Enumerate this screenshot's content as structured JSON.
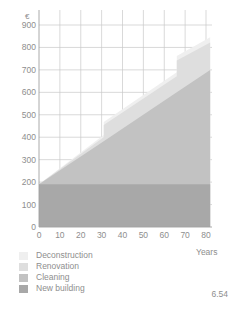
{
  "figure": {
    "number": "6.54"
  },
  "chart_data": {
    "type": "area",
    "title": "",
    "subtitle": "",
    "xlabel": "Years",
    "ylabel": "€",
    "xlim": [
      0,
      82
    ],
    "ylim": [
      0,
      950
    ],
    "grid": true,
    "stacked": true,
    "legend_position": "below",
    "xticks": [
      0,
      10,
      20,
      30,
      40,
      50,
      60,
      70,
      80
    ],
    "xtick_labels": [
      "0",
      "10",
      "20",
      "30",
      "40",
      "50",
      "60",
      "70",
      "80"
    ],
    "yticks": [
      0,
      100,
      200,
      300,
      400,
      500,
      600,
      700,
      800,
      900
    ],
    "ytick_labels": [
      "0",
      "100",
      "200",
      "300",
      "400",
      "500",
      "600",
      "700",
      "800",
      "900"
    ],
    "x": [
      0,
      31,
      31,
      66,
      66,
      82
    ],
    "series": [
      {
        "name": "New building",
        "color": "#a8a8a8",
        "cumulative_top": [
          190,
          190,
          190,
          190,
          190,
          190
        ]
      },
      {
        "name": "Cleaning",
        "color": "#c2c2c2",
        "cumulative_top": [
          190,
          382,
          382,
          600,
          600,
          700
        ]
      },
      {
        "name": "Renovation",
        "color": "#dedede",
        "cumulative_top": [
          190,
          400,
          455,
          672,
          742,
          822
        ]
      },
      {
        "name": "Deconstruction",
        "color": "#efefef",
        "cumulative_top": [
          190,
          410,
          468,
          690,
          762,
          845
        ]
      }
    ]
  },
  "legend": {
    "items": [
      {
        "label": "Deconstruction",
        "color": "#efefef"
      },
      {
        "label": "Renovation",
        "color": "#dedede"
      },
      {
        "label": "Cleaning",
        "color": "#c2c2c2"
      },
      {
        "label": "New building",
        "color": "#a8a8a8"
      }
    ]
  }
}
